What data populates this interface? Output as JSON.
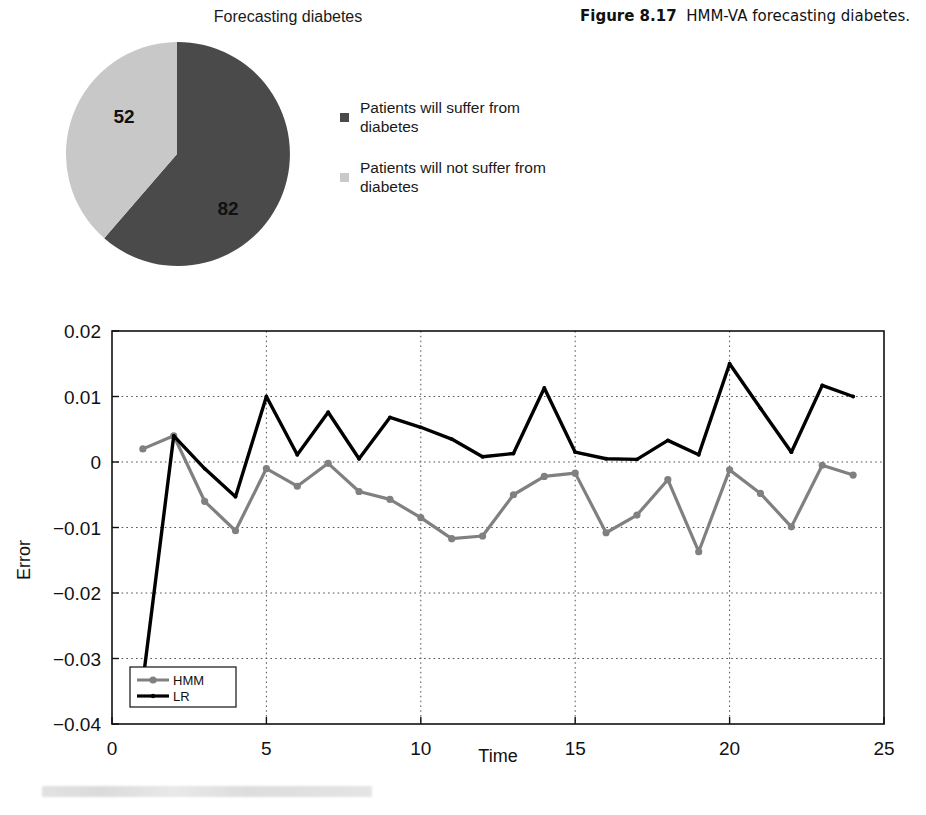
{
  "pie": {
    "title": "Forecasting diabetes",
    "slices": [
      {
        "label": "82",
        "value": 82,
        "name": "Patients will suffer from diabetes",
        "color": "#4a4a4a"
      },
      {
        "label": "52",
        "value": 52,
        "name": "Patients will not suffer from diabetes",
        "color": "#c8c8c8"
      }
    ],
    "legend": [
      {
        "text": "Patients will suffer from diabetes",
        "color": "#4a4a4a"
      },
      {
        "text": "Patients will not suffer from diabetes",
        "color": "#c9c9c9"
      }
    ]
  },
  "caption": {
    "number": "Figure 8.17",
    "text": "HMM-VA forecasting diabetes."
  },
  "chart_data": {
    "type": "line",
    "title": "",
    "xlabel": "Time",
    "ylabel": "Error",
    "xlim": [
      0,
      25
    ],
    "ylim": [
      -0.04,
      0.02
    ],
    "xticks": [
      "0",
      "5",
      "10",
      "15",
      "20",
      "25"
    ],
    "yticks": [
      "0.02",
      "0.01",
      "0",
      "-0.01",
      "-0.02",
      "-0.03",
      "-0.04"
    ],
    "grid": true,
    "legend_position": "bottom-left",
    "x": [
      1,
      2,
      3,
      4,
      5,
      6,
      7,
      8,
      9,
      10,
      11,
      12,
      13,
      14,
      15,
      16,
      17,
      18,
      19,
      20,
      21,
      22,
      23,
      24
    ],
    "series": [
      {
        "name": "HMM",
        "color": "#808080",
        "marker": "circle",
        "values": [
          0.002,
          0.004,
          -0.006,
          -0.0105,
          -0.001,
          -0.0037,
          -0.0002,
          -0.0045,
          -0.0057,
          -0.0085,
          -0.0117,
          -0.0113,
          -0.005,
          -0.0022,
          -0.0017,
          -0.0108,
          -0.0081,
          -0.0027,
          -0.0137,
          -0.0012,
          -0.0048,
          -0.0099,
          -0.0005,
          -0.002
        ]
      },
      {
        "name": "LR",
        "color": "#000000",
        "marker": "circle",
        "values": [
          -0.0335,
          0.004,
          -0.001,
          -0.0053,
          0.01,
          0.0011,
          0.0076,
          0.0005,
          0.0068,
          0.0053,
          0.0035,
          0.0008,
          0.0013,
          0.0113,
          0.0015,
          0.0005,
          0.0004,
          0.0033,
          0.0011,
          0.015,
          0.0082,
          0.0015,
          0.0117,
          0.01
        ]
      }
    ]
  }
}
